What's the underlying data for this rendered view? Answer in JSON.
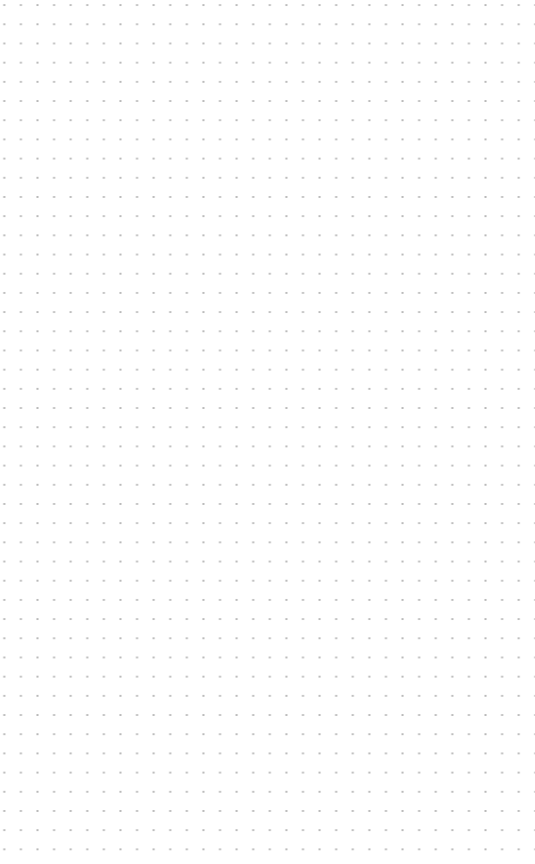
{
  "canvas": {
    "type": "dot-grid",
    "background_color": "#ffffff",
    "dot_color": "#b8b8b8",
    "label": ""
  }
}
